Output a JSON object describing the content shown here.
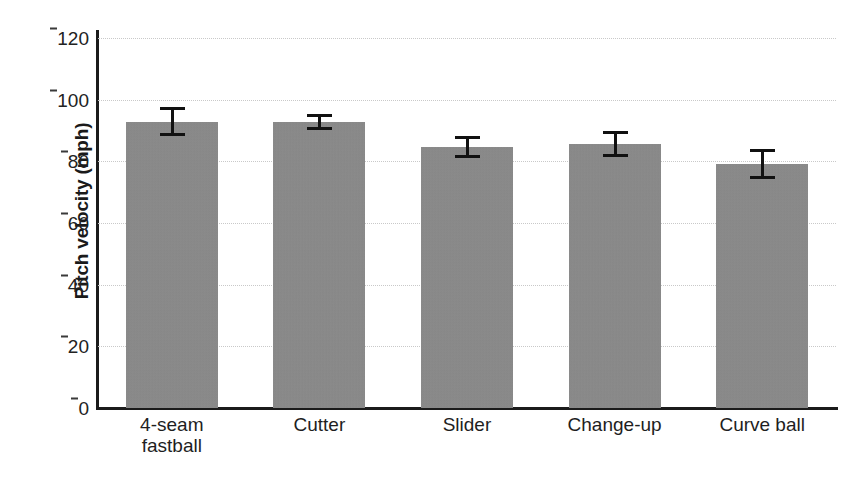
{
  "chart_data": {
    "type": "bar",
    "title": "",
    "xlabel": "",
    "ylabel": "Pitch velocity (mph)",
    "categories": [
      "4-seam\nfastball",
      "Cutter",
      "Slider",
      "Change-up",
      "Curve ball"
    ],
    "category_labels_flat": [
      "4-seam fastball",
      "Cutter",
      "Slider",
      "Change-up",
      "Curve ball"
    ],
    "values": [
      92.9,
      92.7,
      84.7,
      85.6,
      79.2
    ],
    "errors": [
      4.8,
      2.6,
      3.6,
      4.2,
      4.8
    ],
    "series": [
      {
        "name": "Pitch velocity",
        "values": [
          92.9,
          92.7,
          84.7,
          85.6,
          79.2
        ],
        "errors": [
          4.8,
          2.6,
          3.6,
          4.2,
          4.8
        ]
      }
    ],
    "ylim": [
      0,
      120
    ],
    "yticks": [
      0,
      20,
      40,
      60,
      80,
      100,
      120
    ],
    "ytick_labels": [
      "0",
      "20",
      "40",
      "60",
      "80",
      "100",
      "120"
    ],
    "grid": true,
    "grid_axis": "y",
    "grid_style": "dotted",
    "legend": false,
    "legend_position": "none",
    "bar_color": "#8b8b8b",
    "error_color": "#111111",
    "axis_color": "#1b1b1b",
    "grid_color": "#c9c9c9",
    "background": "#ffffff"
  }
}
